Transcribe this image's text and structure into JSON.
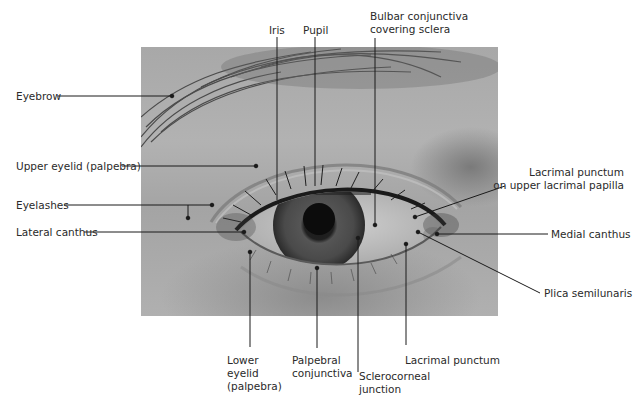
{
  "figure": {
    "type": "anatomical-photo-diagram",
    "colors": {
      "leader_line": "#1a1a1a",
      "label_text": "#2a2a2a",
      "background": "#ffffff"
    }
  },
  "labels": {
    "left": [
      {
        "id": "eyebrow",
        "text": "Eyebrow"
      },
      {
        "id": "upper_eyelid",
        "text": "Upper eyelid (palpebra)"
      },
      {
        "id": "eyelashes",
        "text": "Eyelashes"
      },
      {
        "id": "lateral_canthus",
        "text": "Lateral canthus"
      }
    ],
    "top": [
      {
        "id": "iris",
        "text": "Iris"
      },
      {
        "id": "pupil",
        "text": "Pupil"
      },
      {
        "id": "bulbar_conjunctiva",
        "text": "Bulbar conjunctiva\ncovering sclera"
      }
    ],
    "right": [
      {
        "id": "lacrimal_punctum_upper",
        "text": "Lacrimal punctum\non upper lacrimal papilla"
      },
      {
        "id": "medial_canthus",
        "text": "Medial canthus"
      },
      {
        "id": "plica_semilunaris",
        "text": "Plica semilunaris"
      }
    ],
    "bottom": [
      {
        "id": "lower_eyelid",
        "text": "Lower\neyelid\n(palpebra)"
      },
      {
        "id": "palpebral_conjunctiva",
        "text": "Palpebral\nconjunctiva"
      },
      {
        "id": "sclerocorneal_junction",
        "text": "Sclerocorneal\njunction"
      },
      {
        "id": "lacrimal_punctum",
        "text": "Lacrimal punctum"
      }
    ]
  }
}
